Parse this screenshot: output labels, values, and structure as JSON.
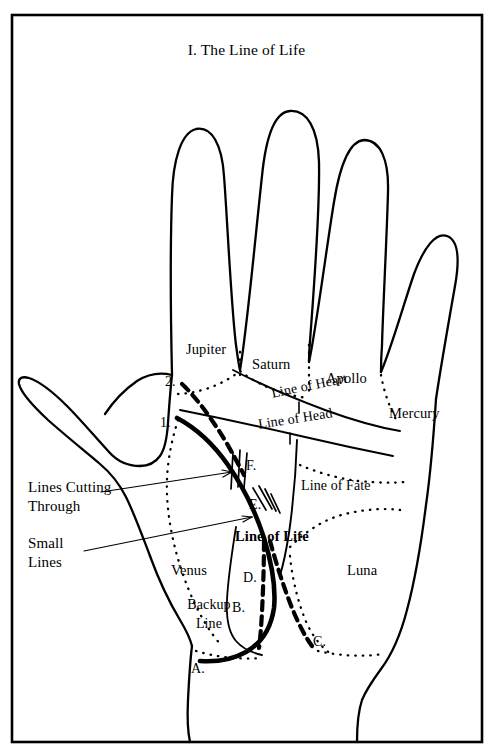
{
  "figure": {
    "title": "I.  The Line of Life",
    "border_color": "#000000",
    "ink_color": "#000000",
    "background": "#ffffff"
  },
  "mounts": [
    {
      "name": "jupiter",
      "label": "Jupiter"
    },
    {
      "name": "saturn",
      "label": "Saturn"
    },
    {
      "name": "apollo",
      "label": "Apollo"
    },
    {
      "name": "mercury",
      "label": "Mercury"
    },
    {
      "name": "venus",
      "label": "Venus"
    },
    {
      "name": "luna",
      "label": "Luna"
    }
  ],
  "lines": [
    {
      "name": "line-of-heart",
      "label": "Line of Heart"
    },
    {
      "name": "line-of-head",
      "label": "Line of Head"
    },
    {
      "name": "line-of-fate",
      "label": "Line of Fate"
    },
    {
      "name": "line-of-life",
      "label": "Line of Life"
    },
    {
      "name": "backup-line",
      "label": "Backup\nLine",
      "line1": "Backup",
      "line2": "Line"
    }
  ],
  "annotations": [
    {
      "name": "lines-cutting-through",
      "line1": "Lines Cutting",
      "line2": "Through"
    },
    {
      "name": "small-lines",
      "line1": "Small",
      "line2": "Lines"
    }
  ],
  "markers": [
    {
      "name": "marker-1",
      "label": "1."
    },
    {
      "name": "marker-2",
      "label": "2."
    },
    {
      "name": "marker-a",
      "label": "A."
    },
    {
      "name": "marker-b",
      "label": "B."
    },
    {
      "name": "marker-c",
      "label": "C."
    },
    {
      "name": "marker-d",
      "label": "D."
    },
    {
      "name": "marker-e",
      "label": "E."
    },
    {
      "name": "marker-f",
      "label": "F."
    }
  ]
}
